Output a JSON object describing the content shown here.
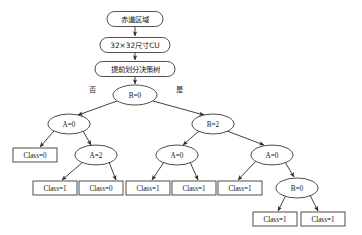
{
  "diagram": {
    "type": "flowchart-decision-tree",
    "colors": {
      "background": "#ffffff",
      "stroke": "#3a3a3a",
      "edge": "#2b2b2b",
      "text": "#141414"
    },
    "flow_nodes": [
      {
        "id": "f1",
        "label": "赤道区域",
        "shape": "rounded-rect",
        "cx": 135,
        "cy": 19,
        "w": 56,
        "h": 15
      },
      {
        "id": "f2",
        "label": "32×32尺寸CU",
        "shape": "rounded-rect",
        "cx": 135,
        "cy": 45,
        "w": 70,
        "h": 15
      },
      {
        "id": "f3",
        "label": "提前划分决策树",
        "shape": "rounded-rect",
        "cx": 135,
        "cy": 69,
        "w": 80,
        "h": 15
      }
    ],
    "decision_nodes": [
      {
        "id": "d0",
        "label": "B=0",
        "shape": "ellipse",
        "cx": 135,
        "cy": 95,
        "rx": 22,
        "ry": 10,
        "level": 0
      },
      {
        "id": "d1",
        "label": "A=0",
        "shape": "ellipse",
        "cx": 69,
        "cy": 124,
        "rx": 21,
        "ry": 10,
        "level": 1
      },
      {
        "id": "d2",
        "label": "B=2",
        "shape": "ellipse",
        "cx": 213,
        "cy": 124,
        "rx": 21,
        "ry": 10,
        "level": 1
      },
      {
        "id": "d3",
        "label": "A=2",
        "shape": "ellipse",
        "cx": 96,
        "cy": 155,
        "rx": 21,
        "ry": 10,
        "level": 2
      },
      {
        "id": "d4",
        "label": "A=0",
        "shape": "ellipse",
        "cx": 177,
        "cy": 155,
        "rx": 21,
        "ry": 10,
        "level": 2
      },
      {
        "id": "d5",
        "label": "A=0",
        "shape": "ellipse",
        "cx": 272,
        "cy": 155,
        "rx": 21,
        "ry": 10,
        "level": 2
      },
      {
        "id": "d6",
        "label": "B=0",
        "shape": "ellipse",
        "cx": 297,
        "cy": 188,
        "rx": 21,
        "ry": 10,
        "level": 3
      }
    ],
    "leaf_nodes": [
      {
        "id": "L1",
        "label": "Class=0",
        "shape": "rect",
        "cx": 35,
        "cy": 155,
        "w": 44,
        "h": 14
      },
      {
        "id": "L2",
        "label": "Class=1",
        "shape": "rect",
        "cx": 55,
        "cy": 188,
        "w": 44,
        "h": 14
      },
      {
        "id": "L3",
        "label": "Class=0",
        "shape": "rect",
        "cx": 101,
        "cy": 188,
        "w": 44,
        "h": 14
      },
      {
        "id": "L4",
        "label": "Class=1",
        "shape": "rect",
        "cx": 148,
        "cy": 188,
        "w": 44,
        "h": 14
      },
      {
        "id": "L5",
        "label": "Class=1",
        "shape": "rect",
        "cx": 194,
        "cy": 188,
        "w": 44,
        "h": 14
      },
      {
        "id": "L6",
        "label": "Class=1",
        "shape": "rect",
        "cx": 240,
        "cy": 188,
        "w": 44,
        "h": 14
      },
      {
        "id": "L7",
        "label": "Class=1",
        "shape": "rect",
        "cx": 275,
        "cy": 219,
        "w": 44,
        "h": 14
      },
      {
        "id": "L8",
        "label": "Class=1",
        "shape": "rect",
        "cx": 323,
        "cy": 219,
        "w": 44,
        "h": 14
      }
    ],
    "edge_labels": [
      {
        "id": "e-no",
        "label": "否",
        "x": 92,
        "y": 89
      },
      {
        "id": "e-yes",
        "label": "是",
        "x": 179,
        "y": 89
      }
    ]
  }
}
